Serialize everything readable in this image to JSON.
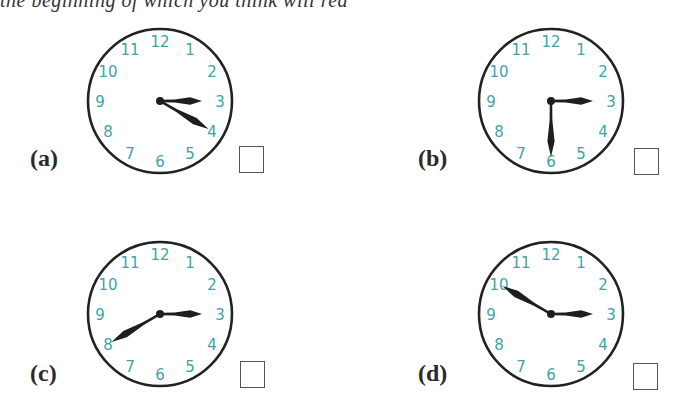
{
  "header": {
    "clipped_instruction": "the beginning of which you think will rea"
  },
  "clock_numbers": [
    "12",
    "1",
    "2",
    "3",
    "4",
    "5",
    "6",
    "7",
    "8",
    "9",
    "10",
    "11"
  ],
  "colors": {
    "numerals": "#3fa3a5",
    "face_outline": "#222222",
    "hands": "#1e1e1e",
    "answer_box_border": "#555555"
  },
  "questions": [
    {
      "id": "a",
      "label": "(a)",
      "hour_hand_points_to": 3,
      "minute_hand_points_to": 4,
      "time_shown": "3:20",
      "checked": false
    },
    {
      "id": "b",
      "label": "(b)",
      "hour_hand_points_to": 3,
      "minute_hand_points_to": 6,
      "time_shown": "3:30",
      "checked": false
    },
    {
      "id": "c",
      "label": "(c)",
      "hour_hand_points_to": 3,
      "minute_hand_points_to": 8,
      "time_shown": "3:40",
      "checked": false
    },
    {
      "id": "d",
      "label": "(d)",
      "hour_hand_points_to": 3,
      "minute_hand_points_to": 10,
      "time_shown": "3:50",
      "checked": false
    }
  ]
}
